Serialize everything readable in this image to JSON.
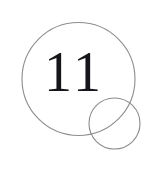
{
  "figure": {
    "kind": "overlapping-circles-diagram",
    "background_color": "#ffffff",
    "canvas": {
      "width": 158,
      "height": 174
    },
    "label": {
      "text": "11",
      "color": "#16161a",
      "font_size_px": 56,
      "center_x": 74,
      "center_y": 78
    },
    "shapes": [
      {
        "name": "large-circle",
        "center_x": 78.5,
        "center_y": 79,
        "radius": 56.5,
        "stroke_color": "#8c8c8c",
        "stroke_width": 1.1,
        "fill": "none"
      },
      {
        "name": "small-circle",
        "center_x": 114.5,
        "center_y": 123.5,
        "radius": 25.5,
        "stroke_color": "#8c8c8c",
        "stroke_width": 1.1,
        "fill": "none"
      }
    ]
  }
}
